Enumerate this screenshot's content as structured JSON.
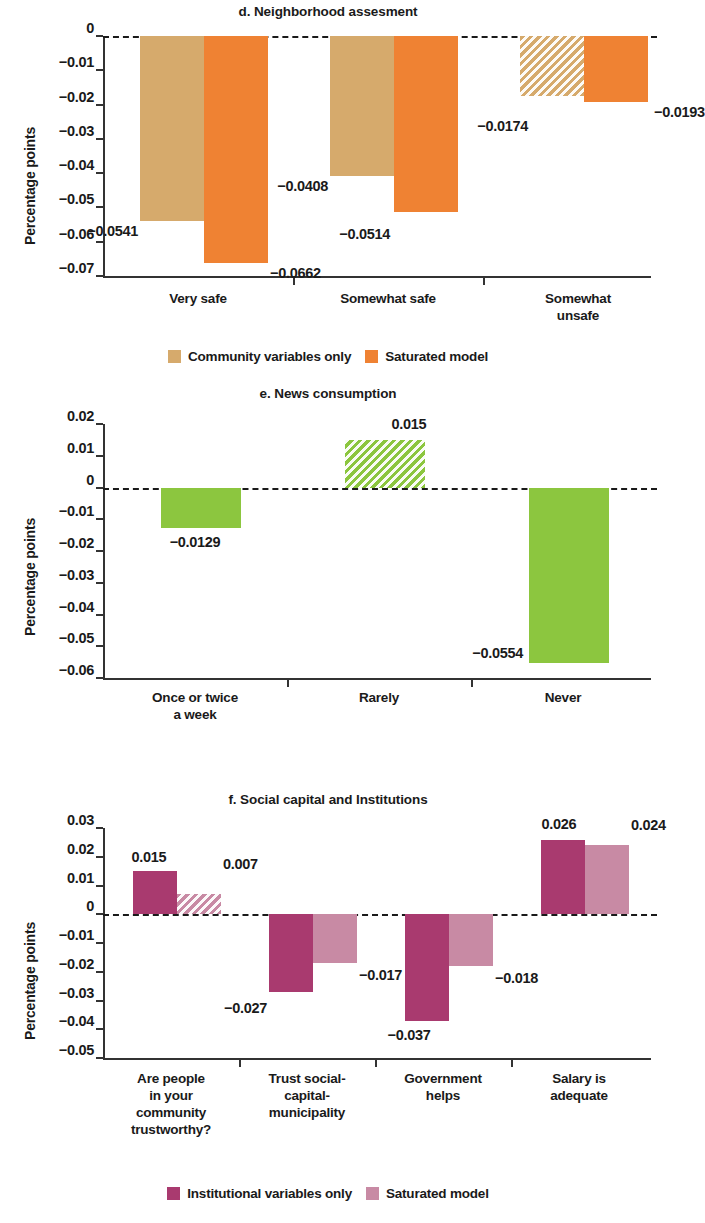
{
  "figure": {
    "yaxis_label": "Percentage points"
  },
  "panels": [
    {
      "id": "d",
      "title": "d. Neighborhood assesment",
      "ylabel": "Percentage points",
      "yticks": [
        "0",
        "−0.01",
        "−0.02",
        "−0.03",
        "−0.04",
        "−0.05",
        "−0.06",
        "−0.07"
      ],
      "categories": [
        "Very safe",
        "Somewhat safe",
        "Somewhat\nunsafe"
      ],
      "legend": [
        {
          "label": "Community variables only",
          "color": "#d6aa6c"
        },
        {
          "label": "Saturated model",
          "color": "#ef8233"
        }
      ],
      "bars": [
        {
          "group": "Very safe",
          "series": "Community variables only",
          "label": "−0.0541",
          "value": -0.0541,
          "hatched": false
        },
        {
          "group": "Very safe",
          "series": "Saturated model",
          "label": "−0.0662",
          "value": -0.0662,
          "hatched": false
        },
        {
          "group": "Somewhat safe",
          "series": "Community variables only",
          "label": "−0.0408",
          "value": -0.0408,
          "hatched": false
        },
        {
          "group": "Somewhat safe",
          "series": "Saturated model",
          "label": "−0.0514",
          "value": -0.0514,
          "hatched": false
        },
        {
          "group": "Somewhat unsafe",
          "series": "Community variables only",
          "label": "−0.0174",
          "value": -0.0174,
          "hatched": true
        },
        {
          "group": "Somewhat unsafe",
          "series": "Saturated model",
          "label": "−0.0193",
          "value": -0.0193,
          "hatched": false
        }
      ]
    },
    {
      "id": "e",
      "title": "e. News consumption",
      "ylabel": "Percentage points",
      "yticks": [
        "0.02",
        "0.01",
        "0",
        "−0.01",
        "−0.02",
        "−0.03",
        "−0.04",
        "−0.05",
        "−0.06"
      ],
      "categories": [
        "Once or twice\na week",
        "Rarely",
        "Never"
      ],
      "legend": [],
      "bars": [
        {
          "group": "Once or twice a week",
          "series": "News",
          "label": "−0.0129",
          "value": -0.0129,
          "hatched": false
        },
        {
          "group": "Rarely",
          "series": "News",
          "label": "0.015",
          "value": 0.015,
          "hatched": true
        },
        {
          "group": "Never",
          "series": "News",
          "label": "−0.0554",
          "value": -0.0554,
          "hatched": false
        }
      ]
    },
    {
      "id": "f",
      "title": "f. Social capital and Institutions",
      "ylabel": "Percentage points",
      "yticks": [
        "0.03",
        "0.02",
        "0.01",
        "0",
        "−0.01",
        "−0.02",
        "−0.03",
        "−0.04",
        "−0.05"
      ],
      "categories": [
        "Are people\nin your\ncommunity\ntrustworthy?",
        "Trust social-\ncapital-\nmunicipality",
        "Government\nhelps",
        "Salary is\nadequate"
      ],
      "legend": [
        {
          "label": "Institutional variables only",
          "color": "#a93a6f"
        },
        {
          "label": "Saturated model",
          "color": "#c88aa4"
        }
      ],
      "bars": [
        {
          "group": "Are people in your community trustworthy?",
          "series": "Institutional variables only",
          "label": "0.015",
          "value": 0.015,
          "hatched": false
        },
        {
          "group": "Are people in your community trustworthy?",
          "series": "Saturated model",
          "label": "0.007",
          "value": 0.007,
          "hatched": true
        },
        {
          "group": "Trust social-capital-municipality",
          "series": "Institutional variables only",
          "label": "−0.027",
          "value": -0.027,
          "hatched": false
        },
        {
          "group": "Trust social-capital-municipality",
          "series": "Saturated model",
          "label": "−0.017",
          "value": -0.017,
          "hatched": false
        },
        {
          "group": "Government helps",
          "series": "Institutional variables only",
          "label": "−0.037",
          "value": -0.037,
          "hatched": false
        },
        {
          "group": "Government helps",
          "series": "Saturated model",
          "label": "−0.018",
          "value": -0.018,
          "hatched": false
        },
        {
          "group": "Salary is adequate",
          "series": "Institutional variables only",
          "label": "0.026",
          "value": 0.026,
          "hatched": false
        },
        {
          "group": "Salary is adequate",
          "series": "Saturated model",
          "label": "0.024",
          "value": 0.024,
          "hatched": false
        }
      ]
    }
  ],
  "chart_data": [
    {
      "type": "bar",
      "title": "d. Neighborhood assesment",
      "xlabel": "",
      "ylabel": "Percentage points",
      "ylim": [
        -0.07,
        0
      ],
      "ytick_values": [
        0,
        -0.01,
        -0.02,
        -0.03,
        -0.04,
        -0.05,
        -0.06,
        -0.07
      ],
      "grid": false,
      "zero_reference_line": 0,
      "legend_position": "bottom",
      "categories": [
        "Very safe",
        "Somewhat safe",
        "Somewhat unsafe"
      ],
      "series": [
        {
          "name": "Community variables only",
          "color": "#d6aa6c",
          "values": [
            -0.0541,
            -0.0408,
            -0.0174
          ],
          "hatched": [
            false,
            false,
            true
          ]
        },
        {
          "name": "Saturated model",
          "color": "#ef8233",
          "values": [
            -0.0662,
            -0.0514,
            -0.0193
          ],
          "hatched": [
            false,
            false,
            false
          ]
        }
      ]
    },
    {
      "type": "bar",
      "title": "e. News consumption",
      "xlabel": "",
      "ylabel": "Percentage points",
      "ylim": [
        -0.06,
        0.02
      ],
      "ytick_values": [
        0.02,
        0.01,
        0,
        -0.01,
        -0.02,
        -0.03,
        -0.04,
        -0.05,
        -0.06
      ],
      "grid": false,
      "zero_reference_line": 0,
      "legend_position": "none",
      "categories": [
        "Once or twice a week",
        "Rarely",
        "Never"
      ],
      "series": [
        {
          "name": "News consumption",
          "color": "#8cc63f",
          "values": [
            -0.0129,
            0.015,
            -0.0554
          ],
          "hatched": [
            false,
            true,
            false
          ]
        }
      ]
    },
    {
      "type": "bar",
      "title": "f. Social capital and Institutions",
      "xlabel": "",
      "ylabel": "Percentage points",
      "ylim": [
        -0.05,
        0.03
      ],
      "ytick_values": [
        0.03,
        0.02,
        0.01,
        0,
        -0.01,
        -0.02,
        -0.03,
        -0.04,
        -0.05
      ],
      "grid": false,
      "zero_reference_line": 0,
      "legend_position": "bottom",
      "categories": [
        "Are people in your community trustworthy?",
        "Trust social-capital-municipality",
        "Government helps",
        "Salary is adequate"
      ],
      "series": [
        {
          "name": "Institutional variables only",
          "color": "#a93a6f",
          "values": [
            0.015,
            -0.027,
            -0.037,
            0.026
          ],
          "hatched": [
            false,
            false,
            false,
            false
          ]
        },
        {
          "name": "Saturated model",
          "color": "#c88aa4",
          "values": [
            0.007,
            -0.017,
            -0.018,
            0.024
          ],
          "hatched": [
            true,
            false,
            false,
            false
          ]
        }
      ]
    }
  ]
}
